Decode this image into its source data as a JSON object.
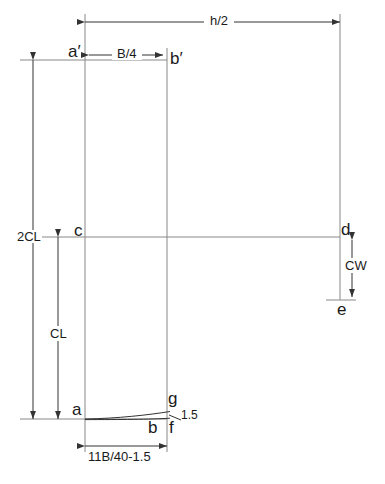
{
  "diagram": {
    "stroke_color": "#555555",
    "text_color": "#1a1a1a",
    "background": "#ffffff",
    "dimensions": {
      "top_overall": "h/2",
      "top_inner": "B/4",
      "left_outer": "2CL",
      "left_inner": "CL",
      "right_drop": "CW",
      "bottom": "11B/40-1.5",
      "corner_small": "1.5"
    },
    "points": {
      "a_prime": "a′",
      "b_prime": "b′",
      "c": "c",
      "d": "d",
      "e": "e",
      "a": "a",
      "b": "b",
      "f": "f",
      "g": "g"
    }
  }
}
